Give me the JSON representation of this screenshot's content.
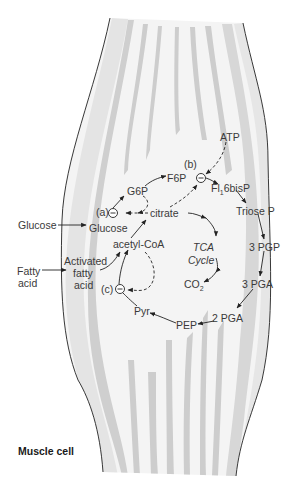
{
  "title": "Muscle cell",
  "colors": {
    "background": "#ffffff",
    "cell_fill": "#f2f2f2",
    "stripe": "#cfcfcf",
    "outline": "#222222",
    "text": "#3a3a3a"
  },
  "external_inputs": [
    {
      "id": "glucose-ext",
      "label": "Glucose"
    },
    {
      "id": "fatty-acid-ext",
      "label_lines": [
        "Fatty",
        "acid"
      ]
    }
  ],
  "metabolites": {
    "glucose": "Glucose",
    "g6p": "G6P",
    "f6p": "F6P",
    "fbp_main": "Fl",
    "fbp_sub": "1",
    "fbp_tail": "6bisP",
    "triose_p": "Triose P",
    "pgp3": "3 PGP",
    "pga3": "3 PGA",
    "pga2": "2 PGA",
    "pep": "PEP",
    "pyr": "Pyr",
    "acetyl_coa": "acetyl-CoA",
    "citrate": "citrate",
    "atp": "ATP",
    "co2_main": "CO",
    "co2_sub": "2",
    "activated_fatty_acid": [
      "Activated",
      "fatty",
      "acid"
    ],
    "tca": [
      "TCA",
      "Cycle"
    ]
  },
  "inhibition_sites": [
    {
      "id": "a",
      "label": "(a)",
      "symbol": "−"
    },
    {
      "id": "b",
      "label": "(b)",
      "symbol": "−"
    },
    {
      "id": "c",
      "label": "(c)",
      "symbol": "−"
    }
  ],
  "pathway_edges": [
    {
      "from": "Glucose (outside)",
      "to": "Glucose",
      "type": "solid"
    },
    {
      "from": "Glucose",
      "to": "G6P",
      "type": "solid",
      "via": "(a)"
    },
    {
      "from": "G6P",
      "to": "F6P",
      "type": "solid"
    },
    {
      "from": "F6P",
      "to": "Fl16bisP",
      "type": "solid",
      "via": "(b)"
    },
    {
      "from": "Fl16bisP",
      "to": "Triose P",
      "type": "solid"
    },
    {
      "from": "Triose P",
      "to": "3 PGP",
      "type": "solid"
    },
    {
      "from": "3 PGP",
      "to": "3 PGA",
      "type": "solid"
    },
    {
      "from": "3 PGA",
      "to": "2 PGA",
      "type": "solid"
    },
    {
      "from": "2 PGA",
      "to": "PEP",
      "type": "solid"
    },
    {
      "from": "PEP",
      "to": "Pyr",
      "type": "solid"
    },
    {
      "from": "Pyr",
      "to": "acetyl-CoA",
      "type": "solid",
      "via": "(c)"
    },
    {
      "from": "Fatty acid (outside)",
      "to": "Activated fatty acid",
      "type": "solid"
    },
    {
      "from": "Activated fatty acid",
      "to": "acetyl-CoA",
      "type": "solid"
    },
    {
      "from": "acetyl-CoA",
      "to": "citrate",
      "type": "solid"
    },
    {
      "from": "citrate",
      "to": "TCA Cycle",
      "type": "solid"
    },
    {
      "from": "TCA Cycle",
      "to": "CO2",
      "type": "solid"
    },
    {
      "from": "G6P",
      "to": "(a)",
      "type": "dashed-inhibition"
    },
    {
      "from": "citrate",
      "to": "(a)",
      "type": "dashed-inhibition"
    },
    {
      "from": "citrate",
      "to": "(b)",
      "type": "dashed-inhibition"
    },
    {
      "from": "ATP",
      "to": "(b)",
      "type": "dashed-inhibition"
    },
    {
      "from": "acetyl-CoA",
      "to": "(c)",
      "type": "dashed-inhibition"
    }
  ]
}
